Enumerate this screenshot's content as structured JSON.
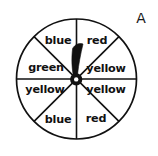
{
  "figure": {
    "tag": "A",
    "type": "spinner-wheel",
    "sector_count": 8,
    "background_color": "#ffffff",
    "line_color": "#111111",
    "text_color": "#111111"
  },
  "wheel": {
    "center_x": 76.5,
    "center_y": 79,
    "radius": 60,
    "needle": {
      "pointing_at": "red",
      "angle_degrees": 12,
      "hub_color": "#111111"
    },
    "sectors": [
      {
        "index": 0,
        "label": "red",
        "start_deg": 0,
        "end_deg": 45,
        "label_x": 97,
        "label_y": 41
      },
      {
        "index": 1,
        "label": "yellow",
        "start_deg": 45,
        "end_deg": 90,
        "label_x": 106,
        "label_y": 69
      },
      {
        "index": 2,
        "label": "yellow",
        "start_deg": 90,
        "end_deg": 135,
        "label_x": 106,
        "label_y": 90
      },
      {
        "index": 3,
        "label": "red",
        "start_deg": 135,
        "end_deg": 180,
        "label_x": 96,
        "label_y": 119
      },
      {
        "index": 4,
        "label": "blue",
        "start_deg": 180,
        "end_deg": 225,
        "label_x": 58,
        "label_y": 120
      },
      {
        "index": 5,
        "label": "yellow",
        "start_deg": 225,
        "end_deg": 270,
        "label_x": 45,
        "label_y": 90
      },
      {
        "index": 6,
        "label": "green",
        "start_deg": 270,
        "end_deg": 315,
        "label_x": 46,
        "label_y": 68
      },
      {
        "index": 7,
        "label": "blue",
        "start_deg": 315,
        "end_deg": 360,
        "label_x": 58,
        "label_y": 41
      }
    ],
    "label_counts": {
      "yellow": 3,
      "red": 2,
      "blue": 2,
      "green": 1
    }
  }
}
